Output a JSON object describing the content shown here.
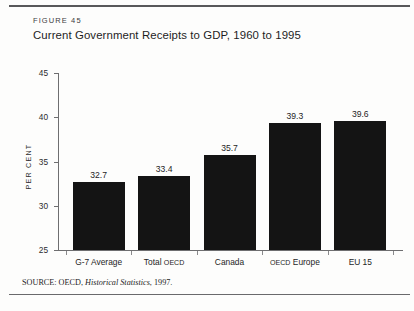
{
  "figure": {
    "label": "FIGURE 45",
    "title": "Current Government Receipts to GDP, 1960 to 1995",
    "source_prefix": "SOURCE: OECD, ",
    "source_italic": "Historical Statistics",
    "source_suffix": ", 1997."
  },
  "chart_data": {
    "type": "bar",
    "title": "Current Government Receipts to GDP, 1960 to 1995",
    "categories": [
      "G-7 Average",
      "Total OECD",
      "Canada",
      "OECD Europe",
      "EU 15"
    ],
    "values": [
      32.7,
      33.4,
      35.7,
      39.3,
      39.6
    ],
    "value_labels": [
      "32.7",
      "33.4",
      "35.7",
      "39.3",
      "39.6"
    ],
    "xlabel": "",
    "ylabel": "PER CENT",
    "ylim": [
      25,
      45
    ],
    "ytick_labels": [
      "25",
      "30",
      "35",
      "40",
      "45"
    ],
    "ytick_values": [
      25,
      30,
      35,
      40,
      45
    ],
    "grid": false,
    "legend": false,
    "bar_color": "#141414"
  },
  "colors": {
    "bar": "#141414",
    "axis": "#6e6e70",
    "rule": "#58585a",
    "text": "#1d1d1f",
    "background": "#fdfdfc"
  }
}
